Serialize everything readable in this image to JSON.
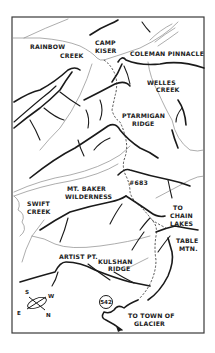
{
  "map": {
    "title": "Ptarmigan Ridge Trail Map",
    "frame": {
      "x": 12,
      "y": 17,
      "width": 192,
      "height": 316
    },
    "labels": {
      "rainbow_creek_1": "RAINBOW",
      "rainbow_creek_2": "CREEK",
      "camp_kiser_1": "CAMP",
      "camp_kiser_2": "KISER",
      "coleman_pinnacle": "COLEMAN PINNACLE",
      "welles_creek_1": "WELLES",
      "welles_creek_2": "CREEK",
      "ptarmigan_ridge_1": "PTARMIGAN",
      "ptarmigan_ridge_2": "RIDGE",
      "trail_number": "#683",
      "mt_baker_1": "MT. BAKER",
      "mt_baker_2": "WILDERNESS",
      "swift_creek_1": "SWIFT",
      "swift_creek_2": "CREEK",
      "chain_lakes_1": "TO",
      "chain_lakes_2": "CHAIN",
      "chain_lakes_3": "LAKES",
      "table_mtn_1": "TABLE",
      "table_mtn_2": "MTN.",
      "artist_pt": "ARTIST PT.",
      "kulshan_ridge_1": "KULSHAN",
      "kulshan_ridge_2": "RIDGE",
      "highway_number": "542",
      "town_1": "TO TOWN OF",
      "town_2": "GLACIER"
    },
    "compass": {
      "north": "N",
      "south": "S",
      "east": "E",
      "west": "W"
    },
    "colors": {
      "ink": "#1a1a1a",
      "creek": "#8a8a8a",
      "background": "#ffffff"
    }
  }
}
